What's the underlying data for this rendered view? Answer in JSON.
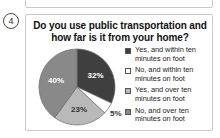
{
  "question_number": "4",
  "card": {
    "title": "Do you use public transportation and how far is it from your home?"
  },
  "chart_data": {
    "type": "pie",
    "title": "Do you use public transportation and how far is it from your home?",
    "xlabel": "",
    "ylabel": "",
    "legend_position": "right",
    "categories": [
      "Yes, and within ten minutes on foot",
      "No, and within ten minutes on foot",
      "Yes, and over ten minutes on foot",
      "No, and over ten minutes on foot"
    ],
    "values": [
      32,
      5,
      23,
      40
    ],
    "labels": [
      "32%",
      "5%",
      "23%",
      "40%"
    ],
    "colors": [
      "#3f3f3f",
      "#ffffff",
      "#b9b9b9",
      "#898989"
    ],
    "label_colors": [
      "#ffffff",
      "#333333",
      "#333333",
      "#ffffff"
    ],
    "start_angle_deg": 0
  },
  "legend": {
    "items": [
      {
        "label": "Yes, and within ten minutes on foot",
        "color": "#3f3f3f",
        "value": "32%"
      },
      {
        "label": "No, and within ten minutes on foot",
        "color": "#ffffff",
        "value": "5%"
      },
      {
        "label": "Yes, and over ten minutes on foot",
        "color": "#b9b9b9",
        "value": "23%"
      },
      {
        "label": "No, and over ten minutes on foot",
        "color": "#898989",
        "value": "40%"
      }
    ]
  }
}
